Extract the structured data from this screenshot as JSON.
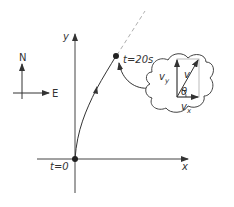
{
  "diagram": {
    "compass": {
      "north_label": "N",
      "east_label": "E"
    },
    "axes": {
      "x_label": "x",
      "y_label": "y"
    },
    "start": {
      "label": "t=0"
    },
    "end": {
      "label": "t=20s"
    },
    "inset": {
      "vy_label": "v",
      "vy_sub": "y",
      "v_label": "v",
      "vx_label": "v",
      "vx_sub": "x",
      "angle_label": "θ"
    },
    "colors": {
      "line": "#333333",
      "grey": "#9a9a9a"
    }
  }
}
